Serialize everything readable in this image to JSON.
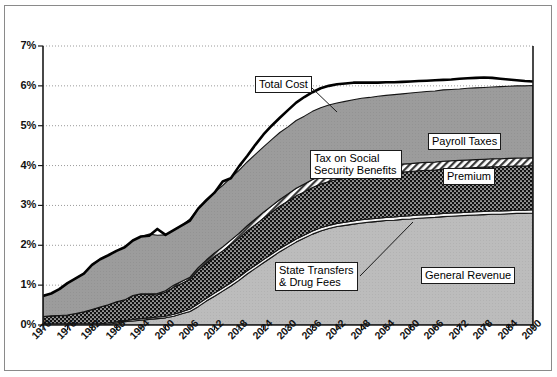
{
  "chart_data": {
    "type": "area",
    "stacked": true,
    "title": "",
    "subtitle": "",
    "xlabel": "",
    "ylabel": "",
    "xlim": [
      1970,
      2090
    ],
    "ylim": [
      0,
      7
    ],
    "ytick_labels": [
      "0%",
      "1%",
      "2%",
      "3%",
      "4%",
      "5%",
      "6%",
      "7%"
    ],
    "ytick_values": [
      0,
      1,
      2,
      3,
      4,
      5,
      6,
      7
    ],
    "xtick_labels": [
      "1970",
      "1976",
      "1982",
      "1988",
      "1994",
      "2000",
      "2006",
      "2012",
      "2018",
      "2024",
      "2030",
      "2036",
      "2042",
      "2048",
      "2054",
      "2060",
      "2066",
      "2072",
      "2078",
      "2084",
      "2090"
    ],
    "xtick_values": [
      1970,
      1976,
      1982,
      1988,
      1994,
      2000,
      2006,
      2012,
      2018,
      2024,
      2030,
      2036,
      2042,
      2048,
      2054,
      2060,
      2066,
      2072,
      2078,
      2084,
      2090
    ],
    "grid": "horizontal-dotted",
    "legend_position": "inline-callouts",
    "units": "percent of GDP",
    "x": [
      1970,
      1972,
      1974,
      1976,
      1978,
      1980,
      1982,
      1984,
      1986,
      1988,
      1990,
      1992,
      1994,
      1996,
      1998,
      2000,
      2002,
      2004,
      2006,
      2008,
      2010,
      2012,
      2014,
      2016,
      2018,
      2020,
      2022,
      2024,
      2026,
      2028,
      2030,
      2032,
      2034,
      2036,
      2038,
      2040,
      2042,
      2044,
      2046,
      2048,
      2050,
      2052,
      2054,
      2056,
      2058,
      2060,
      2062,
      2064,
      2066,
      2068,
      2070,
      2072,
      2074,
      2076,
      2078,
      2080,
      2082,
      2084,
      2086,
      2088,
      2090
    ],
    "series": [
      {
        "name": "General Revenue",
        "fill": "light-gray-solid",
        "color": "#b9b9b9",
        "values": [
          0.0,
          0.0,
          0.0,
          0.0,
          0.0,
          0.0,
          0.0,
          0.0,
          0.02,
          0.05,
          0.08,
          0.1,
          0.12,
          0.14,
          0.16,
          0.18,
          0.22,
          0.28,
          0.34,
          0.46,
          0.6,
          0.72,
          0.85,
          0.98,
          1.12,
          1.28,
          1.42,
          1.56,
          1.7,
          1.84,
          1.96,
          2.08,
          2.18,
          2.28,
          2.36,
          2.42,
          2.47,
          2.5,
          2.53,
          2.56,
          2.58,
          2.6,
          2.62,
          2.63,
          2.65,
          2.66,
          2.68,
          2.69,
          2.7,
          2.72,
          2.73,
          2.74,
          2.75,
          2.76,
          2.77,
          2.78,
          2.78,
          2.79,
          2.8,
          2.8,
          2.81
        ]
      },
      {
        "name": "State Transfers & Drug Fees",
        "fill": "white-thin-band",
        "color": "#f2f2f2",
        "values": [
          0.03,
          0.03,
          0.03,
          0.03,
          0.03,
          0.03,
          0.03,
          0.03,
          0.03,
          0.03,
          0.03,
          0.04,
          0.04,
          0.04,
          0.04,
          0.04,
          0.05,
          0.05,
          0.06,
          0.07,
          0.07,
          0.08,
          0.08,
          0.08,
          0.08,
          0.08,
          0.08,
          0.08,
          0.08,
          0.08,
          0.08,
          0.08,
          0.08,
          0.08,
          0.08,
          0.08,
          0.08,
          0.08,
          0.08,
          0.08,
          0.08,
          0.08,
          0.08,
          0.08,
          0.08,
          0.08,
          0.08,
          0.08,
          0.08,
          0.08,
          0.08,
          0.08,
          0.08,
          0.08,
          0.08,
          0.08,
          0.08,
          0.08,
          0.08,
          0.08,
          0.08
        ]
      },
      {
        "name": "Premium",
        "fill": "dark-dotted",
        "color": "#1a1a1a",
        "values": [
          0.18,
          0.2,
          0.21,
          0.22,
          0.26,
          0.3,
          0.36,
          0.42,
          0.46,
          0.5,
          0.52,
          0.6,
          0.62,
          0.58,
          0.56,
          0.6,
          0.68,
          0.72,
          0.74,
          0.84,
          0.88,
          0.92,
          0.93,
          0.96,
          0.98,
          1.0,
          1.02,
          1.04,
          1.05,
          1.06,
          1.07,
          1.08,
          1.08,
          1.09,
          1.1,
          1.1,
          1.1,
          1.1,
          1.11,
          1.11,
          1.11,
          1.11,
          1.11,
          1.11,
          1.11,
          1.11,
          1.11,
          1.11,
          1.11,
          1.11,
          1.11,
          1.11,
          1.11,
          1.11,
          1.11,
          1.11,
          1.11,
          1.11,
          1.11,
          1.11,
          1.11
        ]
      },
      {
        "name": "Tax on Social Security Benefits",
        "fill": "diagonal-hatch",
        "color": "#d8d8d8",
        "values": [
          0.0,
          0.0,
          0.0,
          0.0,
          0.0,
          0.0,
          0.0,
          0.0,
          0.0,
          0.0,
          0.0,
          0.0,
          0.0,
          0.02,
          0.03,
          0.04,
          0.05,
          0.05,
          0.06,
          0.07,
          0.08,
          0.09,
          0.1,
          0.11,
          0.12,
          0.13,
          0.14,
          0.15,
          0.16,
          0.17,
          0.18,
          0.19,
          0.2,
          0.2,
          0.2,
          0.2,
          0.2,
          0.2,
          0.2,
          0.2,
          0.2,
          0.2,
          0.2,
          0.2,
          0.2,
          0.2,
          0.2,
          0.2,
          0.2,
          0.2,
          0.2,
          0.2,
          0.2,
          0.2,
          0.2,
          0.2,
          0.2,
          0.2,
          0.2,
          0.2,
          0.2
        ]
      },
      {
        "name": "Payroll Taxes",
        "fill": "medium-gray-solid",
        "color": "#9a9a9a",
        "values": [
          0.52,
          0.56,
          0.66,
          0.8,
          0.88,
          0.96,
          1.12,
          1.2,
          1.24,
          1.28,
          1.32,
          1.38,
          1.44,
          1.5,
          1.46,
          1.4,
          1.38,
          1.4,
          1.46,
          1.48,
          1.5,
          1.52,
          1.54,
          1.56,
          1.58,
          1.6,
          1.62,
          1.64,
          1.66,
          1.68,
          1.68,
          1.7,
          1.7,
          1.71,
          1.71,
          1.72,
          1.72,
          1.73,
          1.73,
          1.74,
          1.74,
          1.75,
          1.75,
          1.76,
          1.76,
          1.77,
          1.77,
          1.78,
          1.78,
          1.79,
          1.79,
          1.79,
          1.8,
          1.8,
          1.8,
          1.8,
          1.81,
          1.81,
          1.81,
          1.81,
          1.81
        ]
      }
    ],
    "total_cost_line": {
      "name": "Total Cost",
      "style": "thick-black-line",
      "color": "#000000",
      "values": [
        0.73,
        0.79,
        0.9,
        1.05,
        1.17,
        1.29,
        1.51,
        1.65,
        1.75,
        1.86,
        1.95,
        2.12,
        2.22,
        2.24,
        2.41,
        2.26,
        2.38,
        2.5,
        2.62,
        2.92,
        3.13,
        3.32,
        3.6,
        3.68,
        3.98,
        4.24,
        4.52,
        4.78,
        5.0,
        5.2,
        5.39,
        5.58,
        5.72,
        5.84,
        5.94,
        6.0,
        6.04,
        6.06,
        6.08,
        6.08,
        6.08,
        6.08,
        6.09,
        6.09,
        6.1,
        6.11,
        6.12,
        6.13,
        6.14,
        6.15,
        6.16,
        6.18,
        6.19,
        6.2,
        6.21,
        6.2,
        6.18,
        6.16,
        6.14,
        6.12,
        6.11
      ]
    },
    "annotations": [
      {
        "id": "total-cost",
        "label": "Total Cost",
        "has_leader_line": true
      },
      {
        "id": "payroll-taxes",
        "label": "Payroll Taxes",
        "has_leader_line": false
      },
      {
        "id": "tax-on-social-security-benefits",
        "label": "Tax on Social\nSecurity Benefits",
        "line1": "Tax on Social",
        "line2": "Security Benefits",
        "has_leader_line": false
      },
      {
        "id": "premium",
        "label": "Premium",
        "has_leader_line": false
      },
      {
        "id": "state-transfers-drug-fees",
        "label": "State Transfers\n& Drug Fees",
        "line1": "State Transfers",
        "line2": "& Drug Fees",
        "has_leader_line": true
      },
      {
        "id": "general-revenue",
        "label": "General Revenue",
        "has_leader_line": false
      }
    ]
  },
  "axes": {
    "y_labels": [
      "7%",
      "6%",
      "5%",
      "4%",
      "3%",
      "2%",
      "1%",
      "0%"
    ],
    "x_labels": [
      "1970",
      "1976",
      "1982",
      "1988",
      "1994",
      "2000",
      "2006",
      "2012",
      "2018",
      "2024",
      "2030",
      "2036",
      "2042",
      "2048",
      "2054",
      "2060",
      "2066",
      "2072",
      "2078",
      "2084",
      "2090"
    ]
  },
  "callouts": {
    "total_cost": "Total Cost",
    "payroll_taxes": "Payroll Taxes",
    "tax_ssb_line1": "Tax on Social",
    "tax_ssb_line2": "Security Benefits",
    "premium": "Premium",
    "state_line1": "State Transfers",
    "state_line2": "& Drug Fees",
    "general_revenue": "General Revenue"
  },
  "colors": {
    "general_revenue": "#b9b9b9",
    "state_transfers": "#f2f2f2",
    "premium": "#1a1a1a",
    "tax_ssb": "#d8d8d8",
    "payroll_taxes": "#9a9a9a",
    "total_cost_line": "#000000",
    "grid": "#9a9a9a",
    "frame": "#8a8a8a"
  }
}
